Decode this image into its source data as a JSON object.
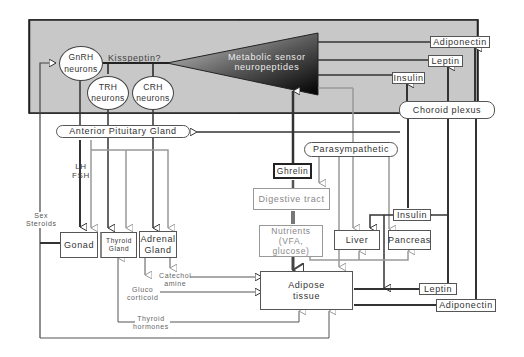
{
  "diagram": {
    "brain_region": {
      "neurons": [
        {
          "id": "gnrh",
          "line1": "GnRH",
          "line2": "neurons"
        },
        {
          "id": "trh",
          "line1": "TRH",
          "line2": "neurons"
        },
        {
          "id": "crh",
          "line1": "CRH",
          "line2": "neurons"
        }
      ],
      "kisspeptin_label": "Kisspeptin?",
      "sensor": {
        "line1": "Metabolic sensor",
        "line2": "neuropeptides"
      },
      "brain_hormones": {
        "adiponectin": "Adiponectin",
        "leptin": "Leptin",
        "insulin": "Insulin"
      },
      "choroid_plexus": "Choroid plexus"
    },
    "anterior_pituitary": "Anterior Pituitary Gland",
    "parasympathetic": "Parasympathetic",
    "ghrelin": "Ghrelin",
    "digestive_tract": "Digestive tract",
    "nutrients": {
      "line1": "Nutrients",
      "line2": "(VFA, glucose)"
    },
    "lh_fsh": {
      "line1": "LH",
      "line2": "FSH"
    },
    "sex_steroids": {
      "line1": "Sex",
      "line2": "Steroids"
    },
    "glands": {
      "gonad": "Gonad",
      "thyroid": {
        "line1": "Thyroid",
        "line2": "Gland"
      },
      "adrenal": {
        "line1": "Adrenal",
        "line2": "Gland"
      }
    },
    "catecholamine": {
      "line1": "Catechol",
      "line2": "amine"
    },
    "glucocorticoid": {
      "line1": "Gluco",
      "line2": "corticoid"
    },
    "thyroid_hormones": {
      "line1": "Thyroid",
      "line2": "hormones"
    },
    "adipose": {
      "line1": "Adipose",
      "line2": "tissue"
    },
    "liver": "Liver",
    "pancreas": "Pancreas",
    "peripheral_hormones": {
      "insulin": "Insulin",
      "leptin": "Leptin",
      "adiponectin": "Adiponectin"
    },
    "colors": {
      "brain_bg": "#c8c8c8",
      "dark_line": "#333333",
      "grey_line": "#999999"
    }
  }
}
